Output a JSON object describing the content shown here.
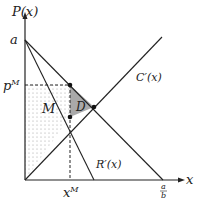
{
  "diagram": {
    "type": "monopoly-deadweight-loss",
    "y_axis_label": "P(x)",
    "x_axis_label": "x",
    "intercept_label": "a",
    "quantity_intercept_label": {
      "num": "a",
      "den": "b"
    },
    "monopoly_price_label": "p",
    "monopoly_price_sup": "M",
    "monopoly_quantity_label": "x",
    "monopoly_quantity_sup": "M",
    "region_monopoly_label": "M",
    "region_deadweight_label": "D",
    "marginal_cost_label": "C′(x)",
    "marginal_revenue_label": "R′(x)",
    "colors": {
      "line": "#222222",
      "deadweight_fill": "#9a9a9a",
      "dots": "#aaaaaa",
      "background": "#ffffff"
    }
  }
}
